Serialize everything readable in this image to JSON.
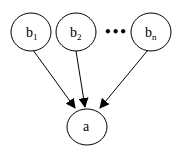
{
  "diagram": {
    "type": "directed-graph",
    "nodes": [
      {
        "id": "b1",
        "base": "b",
        "sub": "1",
        "cx": 31,
        "cy": 32,
        "rx": 20,
        "ry": 19
      },
      {
        "id": "b2",
        "base": "b",
        "sub": "2",
        "cx": 76,
        "cy": 32,
        "rx": 20,
        "ry": 19
      },
      {
        "id": "bn",
        "base": "b",
        "sub": "n",
        "cx": 151,
        "cy": 32,
        "rx": 20,
        "ry": 19
      },
      {
        "id": "a",
        "base": "a",
        "sub": "",
        "cx": 87,
        "cy": 126,
        "rx": 20,
        "ry": 19
      }
    ],
    "ellipsis": "•••",
    "edges": [
      {
        "from": "b1",
        "to": "a"
      },
      {
        "from": "b2",
        "to": "a"
      },
      {
        "from": "bn",
        "to": "a"
      }
    ],
    "colors": {
      "stroke": "#000000",
      "fill": "#ffffff",
      "text": "#000000"
    }
  }
}
